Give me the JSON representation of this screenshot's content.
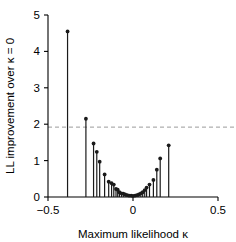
{
  "chart_data": {
    "type": "bar",
    "title": "",
    "subtitle": "",
    "xlabel": "Maximum likelihood κ",
    "ylabel": "LL improvement over κ = 0",
    "xlim": [
      -0.5,
      0.5
    ],
    "ylim": [
      0,
      5
    ],
    "xticks": [
      -0.5,
      0,
      0.5
    ],
    "xticklabels": [
      "−0.5",
      "0",
      "0.5"
    ],
    "yticks": [
      0,
      1,
      2,
      3,
      4,
      5
    ],
    "yticklabels": [
      "0",
      "1",
      "2",
      "3",
      "4",
      "5"
    ],
    "grid": false,
    "legend": null,
    "marker": "filled-circle",
    "stem_color": "#1a1a1a",
    "threshold_line": {
      "value": 1.92,
      "style": "dashed",
      "color": "#9a9a9a",
      "label": ""
    },
    "x": [
      -0.385,
      -0.277,
      -0.232,
      -0.213,
      -0.196,
      -0.167,
      -0.143,
      -0.126,
      -0.113,
      -0.1,
      -0.09,
      -0.08,
      -0.068,
      -0.057,
      -0.046,
      -0.034,
      -0.023,
      -0.011,
      0.0,
      0.012,
      0.023,
      0.034,
      0.046,
      0.057,
      0.069,
      0.08,
      0.097,
      0.12,
      0.14,
      0.16,
      0.21
    ],
    "values": [
      4.55,
      2.15,
      1.47,
      1.24,
      0.97,
      0.62,
      0.42,
      0.38,
      0.34,
      0.22,
      0.2,
      0.13,
      0.1,
      0.09,
      0.07,
      0.05,
      0.04,
      0.04,
      0.03,
      0.04,
      0.05,
      0.07,
      0.1,
      0.13,
      0.19,
      0.26,
      0.34,
      0.47,
      0.75,
      1.06,
      1.42
    ]
  },
  "axes": {
    "x_title": "Maximum likelihood κ",
    "y_title": "LL improvement over κ = 0"
  }
}
